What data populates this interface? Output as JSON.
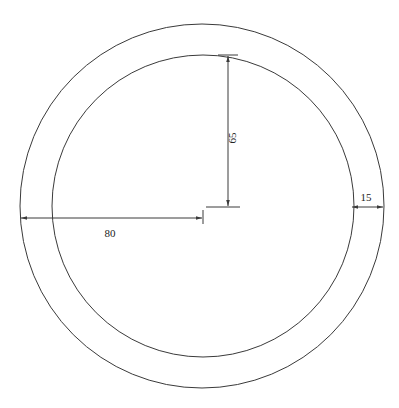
{
  "diagram": {
    "type": "annular-ring-drawing",
    "colors": {
      "background": "#ffffff",
      "line": "#3a3a3a",
      "text": "#222222"
    },
    "outer_circle": {
      "cx": 202,
      "cy": 206,
      "r": 182
    },
    "inner_circle": {
      "cx": 203,
      "cy": 206,
      "r": 151
    },
    "dimensions": {
      "inner_radius": {
        "label": "65",
        "orientation": "vertical"
      },
      "outer_radius": {
        "label": "80",
        "orientation": "horizontal"
      },
      "ring_width": {
        "label": "15",
        "orientation": "horizontal"
      }
    }
  }
}
